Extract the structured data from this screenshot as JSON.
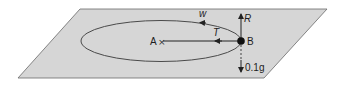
{
  "diagram": {
    "plane_color": "#d4d4d4",
    "line_color": "#3a3a3a",
    "points": {
      "A": {
        "label": "A"
      },
      "B": {
        "label": "B"
      }
    },
    "forces": {
      "tension": "T",
      "reaction": "R",
      "weight": "0.1g",
      "velocity": "w"
    }
  }
}
